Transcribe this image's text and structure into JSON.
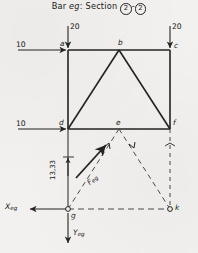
{
  "title": {
    "prefix": "Bar ",
    "bar_name": "eg",
    "middle": ": Section ",
    "section_a": "2",
    "dash": "-",
    "section_b": "2"
  },
  "loads": {
    "top_left_vertical": "20",
    "top_right_vertical": "20",
    "upper_horizontal": "10",
    "lower_horizontal": "10"
  },
  "nodes": {
    "a": "a",
    "b": "b",
    "c": "c",
    "d": "d",
    "e": "e",
    "f": "f",
    "g": "g",
    "k": "k"
  },
  "dimensions": {
    "vertical_dg": "13,33"
  },
  "forces": {
    "member_force": "F",
    "member_force_sub": "eg"
  },
  "axes": {
    "x_label": "X",
    "x_sub": "eg",
    "y_label": "Y",
    "y_sub": "eg"
  },
  "colors": {
    "ink": "#1a1a1a",
    "paper": "#f2f1ef",
    "line": "#232323",
    "dashed": "#4a4a4a"
  }
}
